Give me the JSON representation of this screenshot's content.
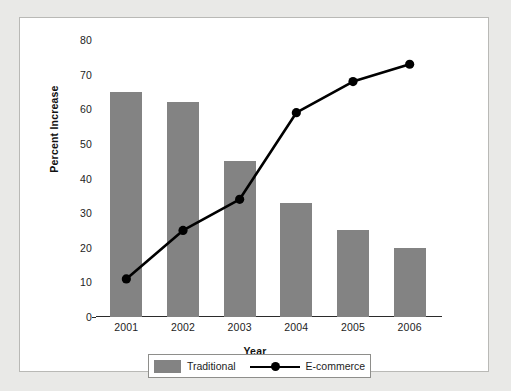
{
  "chart_data": {
    "type": "bar",
    "title": "",
    "xlabel": "Year",
    "ylabel": "Percent Increase",
    "categories": [
      "2001",
      "2002",
      "2003",
      "2004",
      "2005",
      "2006"
    ],
    "ylim": [
      0,
      80
    ],
    "yticks": [
      0,
      10,
      20,
      30,
      40,
      50,
      60,
      70,
      80
    ],
    "ytick_labels": [
      "0",
      "10",
      "20",
      "30",
      "40",
      "50",
      "60",
      "70",
      "80"
    ],
    "grid": false,
    "legend_position": "bottom",
    "series": [
      {
        "name": "Traditional",
        "type": "bar",
        "color": "#838383",
        "values": [
          65,
          62,
          45,
          33,
          25,
          20
        ]
      },
      {
        "name": "E-commerce",
        "type": "line",
        "color": "#000000",
        "marker": "circle",
        "values": [
          11,
          25,
          34,
          59,
          68,
          73
        ]
      }
    ]
  },
  "legend": {
    "items": [
      {
        "label": "Traditional",
        "marker": "bar-swatch"
      },
      {
        "label": "E-commerce",
        "marker": "line-with-dot"
      }
    ]
  },
  "colors": {
    "bar": "#838383",
    "line": "#000000",
    "axis": "#2b2b2b",
    "page_background": "#e9e9e7",
    "panel_background": "#ffffff",
    "panel_border": "#b9b9b6"
  }
}
